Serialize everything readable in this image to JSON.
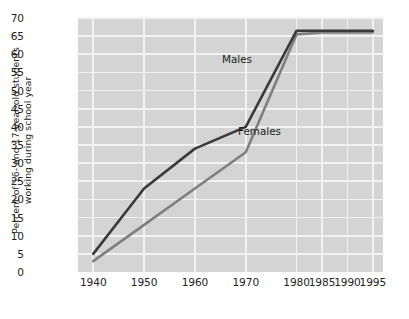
{
  "chart_data": {
    "type": "line",
    "title": "",
    "xlabel": "",
    "ylabel_line1": "Percent of 16- and 17-year-old students",
    "ylabel_line2": "working during school year",
    "categories": [
      "1940",
      "1950",
      "1960",
      "1970",
      "1980",
      "1985",
      "1990",
      "1995"
    ],
    "x": [
      1940,
      1950,
      1960,
      1970,
      1980,
      1985,
      1990,
      1995
    ],
    "xlim": [
      1937,
      1997
    ],
    "ylim": [
      0,
      70
    ],
    "ytick_labels": [
      "0",
      "5",
      "10",
      "15",
      "20",
      "25",
      "30",
      "35",
      "40",
      "45",
      "50",
      "55",
      "60",
      "65",
      "70"
    ],
    "ytick_values": [
      0,
      5,
      10,
      15,
      20,
      25,
      30,
      35,
      40,
      45,
      50,
      55,
      60,
      65,
      70
    ],
    "grid": true,
    "legend_position": "inline-labels",
    "series": [
      {
        "name": "Males",
        "color": "#3a3a3a",
        "values": [
          5,
          23,
          34,
          40,
          66.5,
          66.5,
          66.5,
          66.5
        ],
        "label_text": "Males"
      },
      {
        "name": "Females",
        "color": "#7f7f7f",
        "values": [
          3,
          13,
          23,
          33,
          65.5,
          66,
          66,
          66
        ],
        "label_text": "Females"
      }
    ],
    "plot_background": "#d4d4d4",
    "gridline_color": "#f2f2f2"
  }
}
